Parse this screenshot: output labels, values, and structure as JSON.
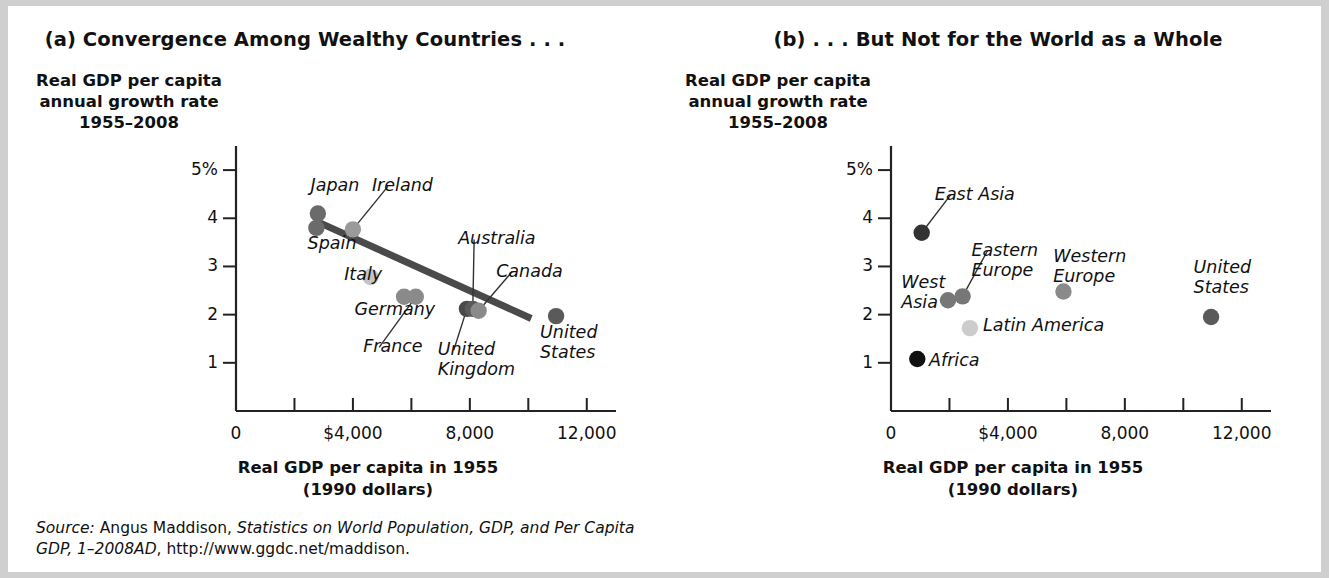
{
  "figure": {
    "source_prefix": "Source:",
    "source_rest": " Angus Maddison, ",
    "source_italic_title": "Statistics on World Population, GDP, and Per Capita GDP, 1–2008AD",
    "source_tail": ", http://www.ggdc.net/maddison."
  },
  "panel_a": {
    "title": "(a) Convergence Among Wealthy Countries . . .",
    "ylabel": "Real GDP per capita\nannual growth rate\n1955–2008",
    "xlabel": "Real GDP per capita in 1955\n(1990 dollars)"
  },
  "panel_b": {
    "title": "(b) . . . But Not for the World as a Whole",
    "ylabel": "Real GDP per capita\nannual growth rate\n1955–2008",
    "xlabel": "Real GDP per capita in 1955\n(1990 dollars)"
  },
  "chart_data": [
    {
      "type": "scatter",
      "panel": "a",
      "title": "(a) Convergence Among Wealthy Countries . . .",
      "xlabel": "Real GDP per capita in 1955 (1990 dollars)",
      "ylabel": "Real GDP per capita annual growth rate 1955–2008",
      "xlim": [
        0,
        13000
      ],
      "ylim": [
        0,
        5.5
      ],
      "xticks": [
        0,
        2000,
        4000,
        6000,
        8000,
        10000,
        12000
      ],
      "xticklabels": [
        "0",
        "",
        "$4,000",
        "",
        "8,000",
        "",
        "12,000"
      ],
      "yticks": [
        1,
        2,
        3,
        4,
        5
      ],
      "yticklabels": [
        "1",
        "2",
        "3",
        "4",
        "5%"
      ],
      "grid": false,
      "legend": "none",
      "points": [
        {
          "label": "Japan",
          "x": 2800,
          "y": 4.1,
          "color": "#6b6b6b"
        },
        {
          "label": "Spain",
          "x": 2750,
          "y": 3.8,
          "color": "#6b6b6b"
        },
        {
          "label": "Ireland",
          "x": 4000,
          "y": 3.77,
          "color": "#9a9a9a"
        },
        {
          "label": "Italy",
          "x": 4600,
          "y": 2.78,
          "color": "#c4c4c4"
        },
        {
          "label": "Germany",
          "x": 5750,
          "y": 2.37,
          "color": "#8a8a8a"
        },
        {
          "label": "France",
          "x": 6150,
          "y": 2.37,
          "color": "#8a8a8a"
        },
        {
          "label": "United Kingdom",
          "x": 7900,
          "y": 2.12,
          "color": "#4a4a4a"
        },
        {
          "label": "Australia",
          "x": 8100,
          "y": 2.12,
          "color": "#5a5a5a"
        },
        {
          "label": "Canada",
          "x": 8300,
          "y": 2.08,
          "color": "#8a8a8a"
        },
        {
          "label": "United States",
          "x": 10950,
          "y": 1.97,
          "color": "#5a5a5a"
        }
      ],
      "trendline": {
        "x0": 2700,
        "y0": 3.95,
        "x1": 10100,
        "y1": 1.92,
        "color": "#4a4a4a"
      },
      "annotations": [
        {
          "text": "Japan",
          "anchor_x": 2550,
          "anchor_y": 4.62,
          "leader": false
        },
        {
          "text": "Spain",
          "anchor_x": 2450,
          "anchor_y": 3.42,
          "leader": false
        },
        {
          "text": "Ireland",
          "anchor_x": 4650,
          "anchor_y": 4.62,
          "leader": true
        },
        {
          "text": "Italy",
          "anchor_x": 3700,
          "anchor_y": 2.78,
          "leader": false
        },
        {
          "text": "Germany",
          "anchor_x": 4050,
          "anchor_y": 2.05,
          "leader": false
        },
        {
          "text": "France",
          "anchor_x": 4350,
          "anchor_y": 1.28,
          "leader": true
        },
        {
          "text": "Australia",
          "anchor_x": 7600,
          "anchor_y": 3.52,
          "leader": true
        },
        {
          "text": "Canada",
          "anchor_x": 8900,
          "anchor_y": 2.85,
          "leader": true
        },
        {
          "text": "United\nKingdom",
          "anchor_x": 6900,
          "anchor_y": 1.22,
          "leader": true
        },
        {
          "text": "United\nStates",
          "anchor_x": 10400,
          "anchor_y": 1.58,
          "leader": false
        }
      ]
    },
    {
      "type": "scatter",
      "panel": "b",
      "title": "(b) . . . But Not for the World as a Whole",
      "xlabel": "Real GDP per capita in 1955 (1990 dollars)",
      "ylabel": "Real GDP per capita annual growth rate 1955–2008",
      "xlim": [
        0,
        13000
      ],
      "ylim": [
        0,
        5.5
      ],
      "xticks": [
        0,
        2000,
        4000,
        6000,
        8000,
        10000,
        12000
      ],
      "xticklabels": [
        "0",
        "",
        "$4,000",
        "",
        "8,000",
        "",
        "12,000"
      ],
      "yticks": [
        1,
        2,
        3,
        4,
        5
      ],
      "yticklabels": [
        "1",
        "2",
        "3",
        "4",
        "5%"
      ],
      "grid": false,
      "legend": "none",
      "points": [
        {
          "label": "East Asia",
          "x": 1050,
          "y": 3.7,
          "color": "#333333"
        },
        {
          "label": "West Asia",
          "x": 1950,
          "y": 2.3,
          "color": "#777777"
        },
        {
          "label": "Eastern Europe",
          "x": 2450,
          "y": 2.38,
          "color": "#777777"
        },
        {
          "label": "Latin America",
          "x": 2700,
          "y": 1.72,
          "color": "#cccccc"
        },
        {
          "label": "Western Europe",
          "x": 5900,
          "y": 2.48,
          "color": "#8a8a8a"
        },
        {
          "label": "United States",
          "x": 10950,
          "y": 1.95,
          "color": "#5a5a5a"
        },
        {
          "label": "Africa",
          "x": 900,
          "y": 1.08,
          "color": "#111111"
        }
      ],
      "annotations": [
        {
          "text": "East Asia",
          "anchor_x": 1500,
          "anchor_y": 4.45,
          "leader": true
        },
        {
          "text": "West\nAsia",
          "anchor_x": 350,
          "anchor_y": 2.62,
          "leader": false
        },
        {
          "text": "Eastern\nEurope",
          "anchor_x": 2750,
          "anchor_y": 3.28,
          "leader": true
        },
        {
          "text": "Western\nEurope",
          "anchor_x": 5550,
          "anchor_y": 3.15,
          "leader": false
        },
        {
          "text": "United\nStates",
          "anchor_x": 10350,
          "anchor_y": 2.92,
          "leader": false
        },
        {
          "text": "Latin America",
          "anchor_x": 3150,
          "anchor_y": 1.72,
          "leader": false
        },
        {
          "text": "Africa",
          "anchor_x": 1300,
          "anchor_y": 1.0,
          "leader": false
        }
      ]
    }
  ]
}
